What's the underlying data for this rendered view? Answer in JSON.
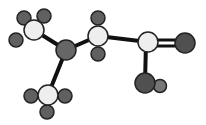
{
  "colors": {
    "carbon": "#eeeeee",
    "nitrogen": "#666666",
    "oxygen": "#505050",
    "hydrogen": "#606060",
    "hydroxyl_hydrogen": "#777777",
    "bond": "#111111"
  },
  "atoms": [
    {
      "id": "c-methyl-left",
      "element": "C"
    },
    {
      "id": "n-center",
      "element": "N"
    },
    {
      "id": "c-alpha",
      "element": "C"
    },
    {
      "id": "c-methyl-bottom",
      "element": "C"
    },
    {
      "id": "c-carboxyl",
      "element": "C"
    },
    {
      "id": "o-double",
      "element": "O"
    },
    {
      "id": "o-hydroxyl",
      "element": "O"
    }
  ],
  "bonds": [
    {
      "from": "c-methyl-left",
      "to": "n-center",
      "order": 1
    },
    {
      "from": "n-center",
      "to": "c-methyl-bottom",
      "order": 1
    },
    {
      "from": "n-center",
      "to": "c-alpha",
      "order": 1
    },
    {
      "from": "c-alpha",
      "to": "c-carboxyl",
      "order": 1
    },
    {
      "from": "c-carboxyl",
      "to": "o-double",
      "order": 2
    },
    {
      "from": "c-carboxyl",
      "to": "o-hydroxyl",
      "order": 1
    }
  ]
}
